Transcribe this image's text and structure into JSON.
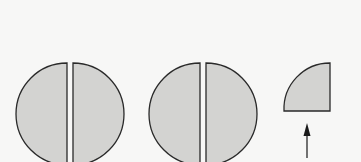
{
  "diagram": {
    "title": "",
    "colors": {
      "background": "#f7f7f6",
      "fill": "#d3d3d1",
      "stroke": "#2a2a2a"
    },
    "shapes": [
      {
        "id": "circle-1",
        "type": "circle-split-halves",
        "cx": 70,
        "cy": 114,
        "r": 51,
        "gap": 6
      },
      {
        "id": "circle-2",
        "type": "circle-split-halves",
        "cx": 203,
        "cy": 114,
        "r": 51,
        "gap": 6
      },
      {
        "id": "quarter",
        "type": "quarter-circle",
        "cx": 330,
        "cy": 111,
        "r": 46
      }
    ],
    "arrow": {
      "x": 307,
      "y_start": 158,
      "y_end": 124,
      "direction": "up"
    }
  }
}
